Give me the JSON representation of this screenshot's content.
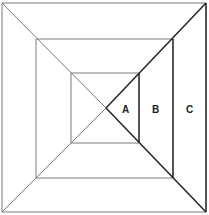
{
  "diagram": {
    "colors": {
      "background": "#ffffff",
      "thin_line": "#7a7a7a",
      "thick_line": "#2a2a2a",
      "label": "#222222"
    },
    "squares": [
      {
        "name": "outer",
        "x1": 2,
        "y1": 3,
        "x2": 206,
        "y2": 212
      },
      {
        "name": "middle",
        "x1": 36,
        "y1": 39,
        "x2": 173,
        "y2": 178
      },
      {
        "name": "inner",
        "x1": 71,
        "y1": 73,
        "x2": 139,
        "y2": 143
      }
    ],
    "center": {
      "x": 106,
      "y": 108
    },
    "regions": [
      {
        "id": "A",
        "label": "A",
        "x": 126,
        "y": 113
      },
      {
        "id": "B",
        "label": "B",
        "x": 156,
        "y": 113
      },
      {
        "id": "C",
        "label": "C",
        "x": 190,
        "y": 113
      }
    ]
  }
}
